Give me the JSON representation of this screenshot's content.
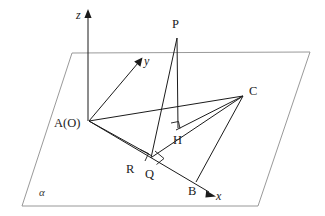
{
  "figure": {
    "type": "solid-geometry-diagram",
    "background_color": "#ffffff",
    "stroke_color": "#1b1b1b",
    "plane_stroke_color": "#8d8d8d",
    "axes": {
      "z": {
        "label": "z",
        "tip": [
          88,
          11
        ],
        "base": [
          88,
          121
        ],
        "arrow": true
      },
      "y": {
        "label": "y",
        "tip": [
          142,
          59
        ],
        "base": [
          89,
          121
        ],
        "arrow": true
      },
      "x": {
        "label": "x",
        "tip": [
          215,
          196
        ],
        "base": [
          89,
          121
        ],
        "arrow": true
      }
    },
    "plane": {
      "label": "α",
      "label_pos": [
        41,
        195
      ],
      "corners": [
        [
          72,
          53
        ],
        [
          310,
          52
        ],
        [
          258,
          206
        ],
        [
          22,
          206
        ]
      ]
    },
    "points": [
      {
        "name": "A(O)",
        "label": "A(O)",
        "x": 89,
        "y": 121,
        "label_x": 54,
        "label_y": 126
      },
      {
        "name": "P",
        "label": "P",
        "x": 177,
        "y": 38,
        "label_x": 172,
        "label_y": 28
      },
      {
        "name": "C",
        "label": "C",
        "x": 243,
        "y": 96,
        "label_x": 250,
        "label_y": 94
      },
      {
        "name": "H",
        "label": "H",
        "x": 178,
        "y": 128,
        "label_x": 175,
        "label_y": 143
      },
      {
        "name": "Q",
        "label": "Q",
        "x": 152,
        "y": 156,
        "label_x": 147,
        "label_y": 177
      },
      {
        "name": "R",
        "label": "R",
        "x": 143,
        "y": 157,
        "label_x": 127,
        "label_y": 172
      },
      {
        "name": "B",
        "label": "B",
        "x": 196,
        "y": 182,
        "label_x": 189,
        "label_y": 194
      }
    ],
    "segments": [
      {
        "from": "A(O)",
        "to": "C"
      },
      {
        "from": "A(O)",
        "to": "B"
      },
      {
        "from": "A(O)",
        "to": "Q"
      },
      {
        "from": "P",
        "to": "H"
      },
      {
        "from": "P",
        "to": "Q"
      },
      {
        "from": "C",
        "to": "Q"
      },
      {
        "from": "C",
        "to": "B"
      },
      {
        "from": "C",
        "to": "H"
      }
    ],
    "right_angles": [
      {
        "at": "H",
        "note": "PH perpendicular to plane"
      },
      {
        "at": "R",
        "note": "right angle on AB"
      },
      {
        "at": "Q",
        "note": "right angle at Q"
      }
    ]
  }
}
